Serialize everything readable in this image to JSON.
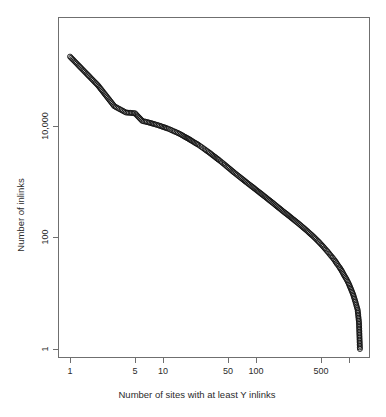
{
  "chart_data": {
    "type": "scatter",
    "title": "",
    "subtitle": "",
    "xlabel": "Number of sites with at least Y inlinks",
    "ylabel": "Number of inlinks",
    "xscale": "log",
    "yscale": "log",
    "grid": false,
    "legend": null,
    "xlim": [
      1,
      1400
    ],
    "ylim": [
      1,
      300000
    ],
    "xticks": [
      1,
      5,
      10,
      50,
      100,
      500,
      1000
    ],
    "xtick_labels": [
      "1",
      "5",
      "10",
      "50",
      "100",
      "500",
      ""
    ],
    "yticks": [
      1,
      100,
      10000
    ],
    "ytick_labels": [
      "1",
      "100",
      "10,000"
    ],
    "marker": "open-circle",
    "marker_color": "#111111",
    "x": [
      1,
      2,
      3,
      4,
      5,
      6,
      7,
      8,
      9,
      10,
      11,
      12,
      13,
      14,
      15,
      16,
      17,
      18,
      19,
      20,
      22,
      24,
      26,
      28,
      30,
      32,
      34,
      36,
      38,
      40,
      43,
      46,
      49,
      52,
      55,
      58,
      62,
      66,
      70,
      74,
      78,
      83,
      88,
      93,
      98,
      104,
      110,
      116,
      123,
      130,
      138,
      146,
      154,
      163,
      172,
      182,
      193,
      204,
      216,
      228,
      241,
      255,
      270,
      286,
      302,
      320,
      338,
      358,
      379,
      401,
      424,
      449,
      475,
      503,
      532,
      563,
      596,
      630,
      667,
      706,
      747,
      790,
      836,
      884,
      935,
      989,
      1046,
      1107,
      1171,
      1239,
      1280,
      1310
    ],
    "y": [
      170000,
      52000,
      22000,
      17000,
      16500,
      12000,
      11300,
      10600,
      10000,
      9400,
      8900,
      8400,
      7900,
      7500,
      7100,
      6700,
      6300,
      6000,
      5700,
      5400,
      4900,
      4500,
      4100,
      3750,
      3450,
      3200,
      2950,
      2750,
      2560,
      2400,
      2180,
      1990,
      1820,
      1680,
      1550,
      1440,
      1320,
      1215,
      1125,
      1045,
      975,
      900,
      835,
      778,
      726,
      672,
      625,
      583,
      540,
      502,
      464,
      431,
      402,
      371,
      345,
      321,
      296,
      275,
      256,
      238,
      221,
      205,
      190,
      176,
      163,
      150,
      139,
      128,
      117,
      108,
      99,
      90,
      82,
      74,
      67,
      60,
      54,
      48,
      43,
      38,
      33,
      29,
      25,
      21,
      18,
      15,
      12,
      9.5,
      7,
      5,
      3,
      1
    ]
  },
  "axes": {
    "x_title": "Number of sites with at least Y inlinks",
    "y_title": "Number of inlinks",
    "x_tick_labels": [
      "1",
      "5",
      "10",
      "50",
      "100",
      "500"
    ],
    "y_tick_labels": [
      "10,000",
      "100",
      "1"
    ]
  },
  "figure": {
    "background": "#ffffff",
    "frame_color": "#6f6f6f",
    "point_color": "#111111"
  }
}
